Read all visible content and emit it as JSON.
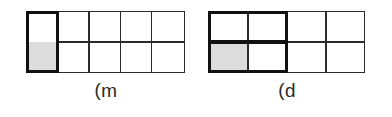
{
  "page": {
    "background_color": "#ffffff",
    "width": 392,
    "height": 117
  },
  "style": {
    "line_color": "#2b2b2b",
    "emphasis_line_color": "#111111",
    "shade_color": "#dcdcdc",
    "caption_color": "#2a2a2a"
  },
  "figures": [
    {
      "id": "figure-a",
      "caption": "m)",
      "caption_rendered": "ɯ)",
      "grid": {
        "columns": 5,
        "rows": 2,
        "total_cells": 10
      },
      "emphasized_region": {
        "description": "first column merged across both rows",
        "col_start": 1,
        "col_span": 1,
        "row_start": 1,
        "row_span": 2,
        "has_internal_divider": false
      },
      "shaded_cells": [
        {
          "col": 1,
          "row": 2
        }
      ],
      "shaded_count": 1,
      "fraction_shaded": "1/10"
    },
    {
      "id": "figure-b",
      "caption": "d)",
      "caption_rendered": "p)",
      "grid": {
        "columns": 4,
        "rows": 2,
        "total_cells": 8
      },
      "emphasized_region": {
        "description": "first two columns merged across both rows",
        "col_start": 1,
        "col_span": 2,
        "row_start": 1,
        "row_span": 2,
        "has_internal_divider": true
      },
      "shaded_cells": [
        {
          "col": 1,
          "row": 2
        }
      ],
      "shaded_count": 1,
      "fraction_shaded": "1/8"
    }
  ]
}
